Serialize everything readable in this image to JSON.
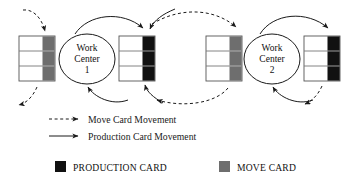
{
  "diagram": {
    "colors": {
      "production_card": "#111111",
      "move_card": "#6e6e6e",
      "stroke": "#1a1a1a",
      "stack_border": "#555555",
      "background": "#ffffff"
    },
    "work_centers": [
      {
        "id": "wc1",
        "line1": "Work",
        "line2": "Center",
        "line3": "1",
        "cx": 87,
        "cy": 59,
        "rx": 28,
        "ry": 25
      },
      {
        "id": "wc2",
        "line1": "Work",
        "line2": "Center",
        "line3": "2",
        "cx": 272,
        "cy": 59,
        "rx": 28,
        "ry": 25
      }
    ],
    "card_stacks": [
      {
        "id": "stack-1",
        "x": 19,
        "y": 36,
        "width": 36,
        "height": 45,
        "rows": 3,
        "card_type": "move",
        "marker_color": "#6e6e6e"
      },
      {
        "id": "stack-2",
        "x": 119,
        "y": 36,
        "width": 36,
        "height": 45,
        "rows": 3,
        "card_type": "production",
        "marker_color": "#111111"
      },
      {
        "id": "stack-3",
        "x": 206,
        "y": 36,
        "width": 36,
        "height": 45,
        "rows": 3,
        "card_type": "move",
        "marker_color": "#6e6e6e"
      },
      {
        "id": "stack-4",
        "x": 304,
        "y": 36,
        "width": 36,
        "height": 45,
        "rows": 3,
        "card_type": "production",
        "marker_color": "#111111"
      }
    ],
    "flow_legend": [
      {
        "id": "move-card-movement",
        "label": "Move Card Movement",
        "style": "dashed"
      },
      {
        "id": "production-card-movement",
        "label": "Production Card Movement",
        "style": "solid"
      }
    ],
    "card_legend": [
      {
        "id": "production-card",
        "label": "PRODUCTION CARD",
        "swatch": "#111111"
      },
      {
        "id": "move-card",
        "label": "MOVE CARD",
        "swatch": "#6e6e6e"
      }
    ]
  }
}
